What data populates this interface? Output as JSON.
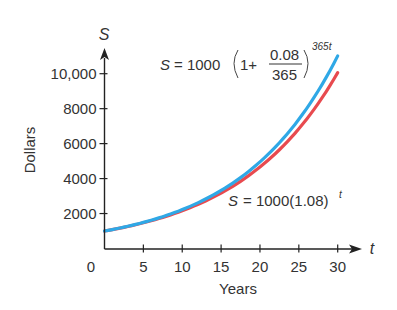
{
  "chart_data": {
    "type": "line",
    "title": "",
    "xlabel": "Years",
    "ylabel": "Dollars",
    "x_axis_variable": "t",
    "y_axis_variable": "S",
    "xlim": [
      0,
      30
    ],
    "ylim": [
      0,
      10000
    ],
    "x_ticks": [
      0,
      5,
      10,
      15,
      20,
      25,
      30
    ],
    "x_tick_labels": [
      "0",
      "5",
      "10",
      "15",
      "20",
      "25",
      "30"
    ],
    "y_ticks": [
      2000,
      4000,
      6000,
      8000,
      10000
    ],
    "y_tick_labels": [
      "2000",
      "4000",
      "6000",
      "8000",
      "10,000"
    ],
    "grid": false,
    "x": [
      0,
      5,
      10,
      15,
      20,
      25,
      30
    ],
    "series": [
      {
        "name": "S = 1000(1 + 0.08/365)^(365t)",
        "label_parts": {
          "lhs": "S",
          "eq": "= 1000",
          "one": "1+",
          "num": "0.08",
          "den": "365",
          "exp": "365t"
        },
        "color": "#2fa8e6",
        "values": [
          1000,
          1492,
          2225,
          3320,
          4953,
          7389,
          11020
        ]
      },
      {
        "name": "S = 1000(1.08)^t",
        "label_parts": {
          "lhs": "S",
          "eq": "= 1000(1.08)",
          "exp": "t"
        },
        "color": "#e84a4f",
        "values": [
          1000,
          1469,
          2159,
          3172,
          4661,
          6848,
          10063
        ]
      }
    ]
  }
}
